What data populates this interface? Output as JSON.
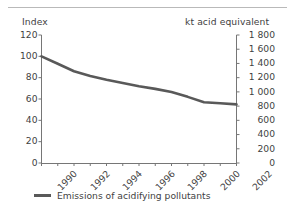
{
  "chart_data": {
    "type": "line",
    "title": "",
    "xlabel": "",
    "ylabel": "Index",
    "y2label": "kt acid equivalent",
    "grid": false,
    "legend_position": "bottom-left",
    "x": [
      1990,
      1991,
      1992,
      1993,
      1994,
      1995,
      1996,
      1997,
      1998,
      1999,
      2000,
      2001,
      2002
    ],
    "xlim": [
      1990,
      2002
    ],
    "xticks": [
      1990,
      1991,
      1992,
      1993,
      1994,
      1995,
      1996,
      1997,
      1998,
      1999,
      2000,
      2001,
      2002
    ],
    "xticklabels": [
      "1990",
      "",
      "1992",
      "",
      "1994",
      "",
      "1996",
      "",
      "1998",
      "",
      "2000",
      "",
      "2002"
    ],
    "xticklabels_shown": [
      "1990",
      "1992",
      "1994",
      "1996",
      "1998",
      "2000",
      "2002"
    ],
    "ylim": [
      0,
      120
    ],
    "yticks": [
      0,
      20,
      40,
      60,
      80,
      100,
      120
    ],
    "yticklabels": [
      "0",
      "20",
      "40",
      "60",
      "80",
      "100",
      "120"
    ],
    "y2lim": [
      0,
      1800
    ],
    "y2ticks": [
      0,
      200,
      400,
      600,
      800,
      1000,
      1200,
      1400,
      1600,
      1800
    ],
    "y2ticklabels": [
      "0",
      "200",
      "400",
      "600",
      "800",
      "1 000",
      "1 200",
      "1 400",
      "1 600",
      "1 800"
    ],
    "series": [
      {
        "name": "Emissions of acidifying pollutants",
        "color": "#595959",
        "linewidth": 2.6,
        "values": [
          100,
          93,
          86,
          81.5,
          78,
          75,
          72,
          69.5,
          66.5,
          62,
          57,
          56,
          55
        ]
      }
    ]
  },
  "axes": {
    "left_title": "Index",
    "right_title": "kt acid equivalent"
  },
  "legend": {
    "items": [
      {
        "label": "Emissions of acidifying pollutants",
        "color": "#595959"
      }
    ]
  },
  "colors": {
    "line": "#595959",
    "axis": "#767676",
    "text": "#3f3f3f",
    "rule": "#b9b9b9",
    "background": "#ffffff"
  }
}
